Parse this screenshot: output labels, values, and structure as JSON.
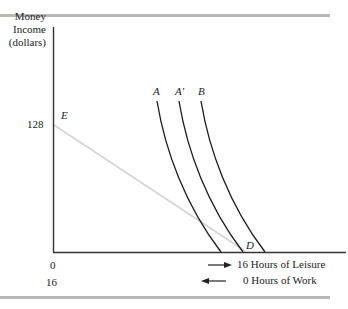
{
  "diagram": {
    "y_axis_label": [
      "Money",
      "Income",
      "(dollars)"
    ],
    "y_tick": "128",
    "x_origin_labels": {
      "top": "0",
      "bottom": "16"
    },
    "x_legend": [
      {
        "arrow": "right",
        "text": "16 Hours of Leisure"
      },
      {
        "arrow": "left",
        "text": "0 Hours of Work"
      }
    ],
    "points": {
      "E": "E",
      "D": "D"
    },
    "curves": [
      {
        "label": "A"
      },
      {
        "label": "A'"
      },
      {
        "label": "B"
      }
    ],
    "colors": {
      "axis": "#333333",
      "curve": "#1a1a1a",
      "budget_line": "#d0d0d0",
      "rule": "#b8b8b8"
    }
  }
}
